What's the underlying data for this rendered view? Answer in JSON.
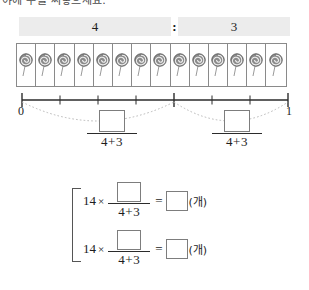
{
  "heading": {
    "text": "야에 수를 써넣으세요."
  },
  "ratio": {
    "left_value": "4",
    "separator": ":",
    "right_value": "3"
  },
  "candies": {
    "icon": "lollipop-icon",
    "count": 14
  },
  "numberline": {
    "start_label": "0",
    "end_label": "1",
    "segments": 7,
    "marks": [
      0,
      4,
      7
    ],
    "arcs": [
      {
        "from": 0,
        "to": 4
      },
      {
        "from": 4,
        "to": 7
      }
    ]
  },
  "fractions": [
    {
      "numerator": "",
      "denominator": "4+3"
    },
    {
      "numerator": "",
      "denominator": "4+3"
    }
  ],
  "equations": [
    {
      "lead": "14",
      "times": "×",
      "numerator": "",
      "denominator": "4+3",
      "equals": "=",
      "answer": "",
      "unit": "(개)"
    },
    {
      "lead": "14",
      "times": "×",
      "numerator": "",
      "denominator": "4+3",
      "equals": "=",
      "answer": "",
      "unit": "(개)"
    }
  ],
  "colors": {
    "bar_fill": "#ececec",
    "ink": "#1d1d1d",
    "box_border": "#7d7d7d",
    "candy_body": "#8c8c8c"
  }
}
